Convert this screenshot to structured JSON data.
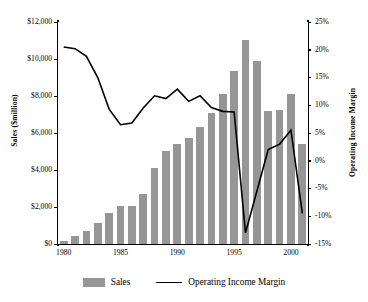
{
  "chart_data": {
    "type": "bar",
    "title": "",
    "subtitle": "",
    "xlabel": "",
    "ylabel": "Sales ($million)",
    "y2label": "Operating Income Margin",
    "grid": false,
    "legend_position": "bottom",
    "ylim": [
      0,
      12000
    ],
    "y2lim": [
      -15,
      25
    ],
    "xlim": [
      1980,
      2001
    ],
    "categories": [
      "1980",
      "1981",
      "1982",
      "1983",
      "1984",
      "1985",
      "1986",
      "1987",
      "1988",
      "1989",
      "1990",
      "1991",
      "1992",
      "1993",
      "1994",
      "1995",
      "1996",
      "1997",
      "1998",
      "1999",
      "2000",
      "2001"
    ],
    "x_tick_labels": [
      "1980",
      "1985",
      "1990",
      "1995",
      "2000"
    ],
    "y_tick_labels": [
      "$0",
      "$2,000",
      "$4,000",
      "$6,000",
      "$8,000",
      "$10,000",
      "$12,000"
    ],
    "y_tick_values": [
      0,
      2000,
      4000,
      6000,
      8000,
      10000,
      12000
    ],
    "y2_tick_labels": [
      "-15%",
      "-10%",
      "-5%",
      "0%",
      "5%",
      "10%",
      "15%",
      "20%",
      "25%"
    ],
    "y2_tick_values": [
      -15,
      -10,
      -5,
      0,
      5,
      10,
      15,
      20,
      25
    ],
    "series": [
      {
        "name": "Sales",
        "type": "bar",
        "axis": "left",
        "unit": "$million",
        "color": "#969696",
        "values": [
          150,
          450,
          700,
          1150,
          1700,
          2050,
          2030,
          2700,
          4100,
          5050,
          5400,
          5750,
          6350,
          7100,
          8100,
          9350,
          11050,
          9900,
          7200,
          7250,
          8100,
          5400
        ]
      },
      {
        "name": "Operating Income Margin",
        "type": "line",
        "axis": "right",
        "unit": "%",
        "color": "#000000",
        "values": [
          20.5,
          20.2,
          18.8,
          15.0,
          9.3,
          6.5,
          6.8,
          9.5,
          11.7,
          11.2,
          12.9,
          10.7,
          11.7,
          9.6,
          8.9,
          8.8,
          -13.0,
          -5.5,
          2.0,
          3.0,
          5.5,
          -9.5
        ]
      }
    ]
  },
  "legend": {
    "items": [
      {
        "label": "Sales",
        "marker": "bar-swatch",
        "color": "#969696"
      },
      {
        "label": "Operating Income Margin",
        "marker": "line-swatch",
        "color": "#000000"
      }
    ]
  },
  "axes": {
    "left_title": "Sales ($million)",
    "right_title": "Operating Income Margin"
  }
}
